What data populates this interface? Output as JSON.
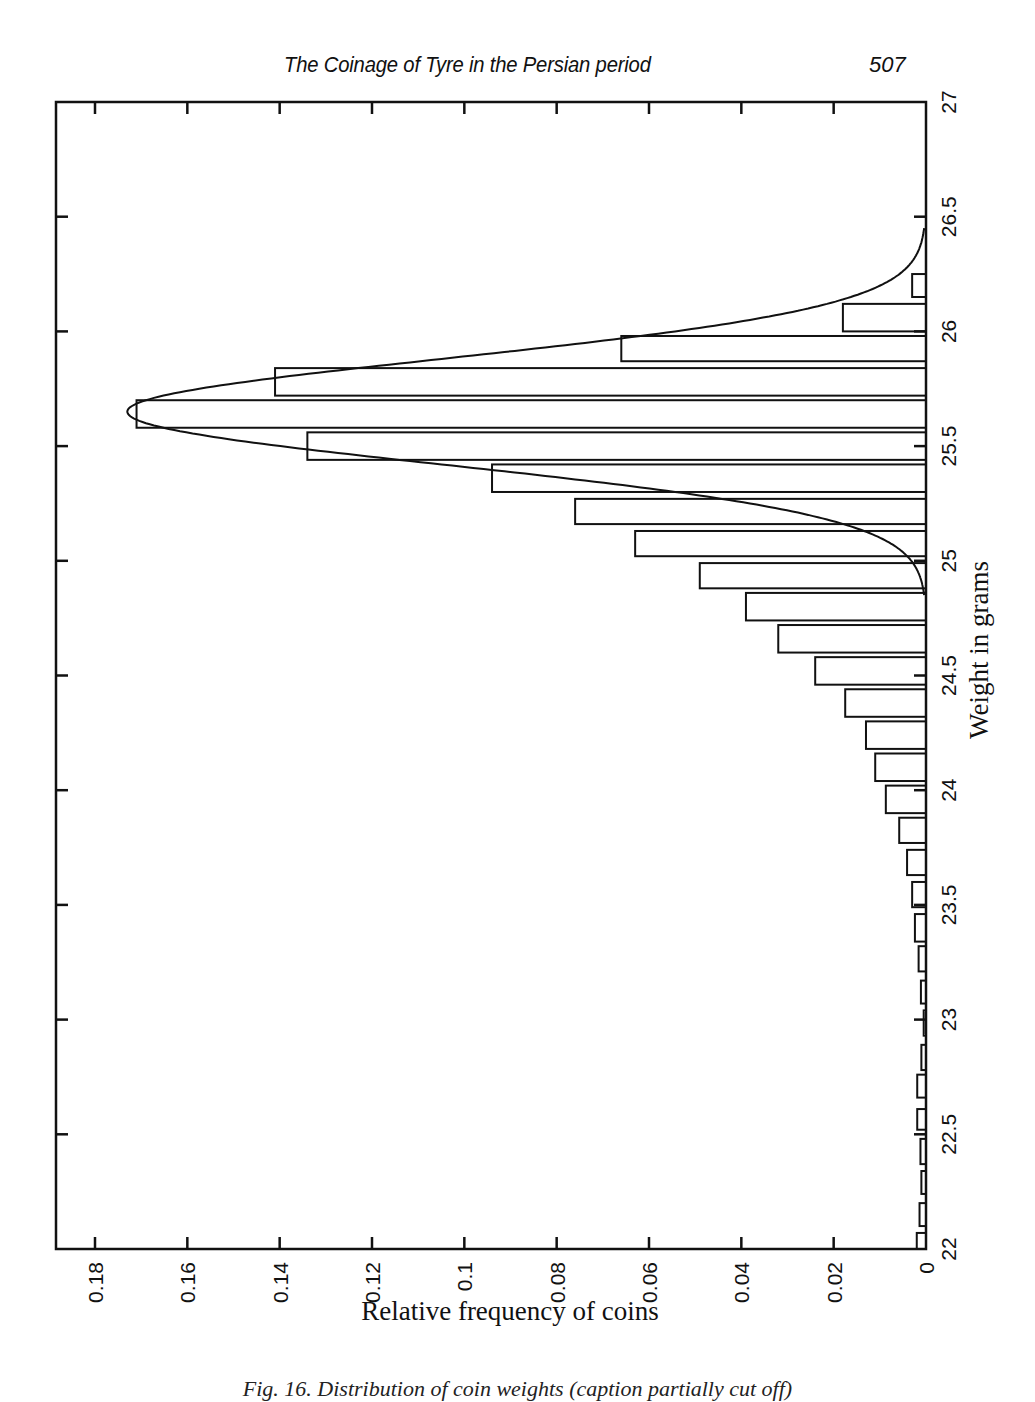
{
  "header": {
    "running_title": "The Coinage of Tyre in the Persian period",
    "page_number": "507"
  },
  "caption": "Fig. 16. Distribution of coin weights (caption partially cut off)",
  "chart_data": {
    "type": "bar",
    "orientation": "horizontal (rotated page: weight runs vertically, frequency runs right-to-left)",
    "title": "",
    "xlabel": "Weight in grams",
    "ylabel": "Relative frequency of coins",
    "xlim": [
      22,
      27
    ],
    "ylim": [
      0,
      0.19
    ],
    "x_ticks": [
      "22",
      "22.5",
      "23",
      "23.5",
      "24",
      "24.5",
      "25",
      "25.5",
      "26",
      "26.5",
      "27"
    ],
    "y_ticks": [
      "0",
      "0.02",
      "0.04",
      "0.06",
      "0.08",
      "0.1",
      "0.12",
      "0.14",
      "0.16",
      "0.18"
    ],
    "grid": false,
    "legend": null,
    "bins": [
      {
        "from": 22.0,
        "to": 22.07,
        "freq": 0.002
      },
      {
        "from": 22.1,
        "to": 22.2,
        "freq": 0.0014
      },
      {
        "from": 22.24,
        "to": 22.34,
        "freq": 0.001
      },
      {
        "from": 22.37,
        "to": 22.48,
        "freq": 0.0012
      },
      {
        "from": 22.52,
        "to": 22.61,
        "freq": 0.0019
      },
      {
        "from": 22.66,
        "to": 22.76,
        "freq": 0.0019
      },
      {
        "from": 22.78,
        "to": 22.89,
        "freq": 0.001
      },
      {
        "from": 22.93,
        "to": 23.04,
        "freq": 0.0005
      },
      {
        "from": 23.07,
        "to": 23.17,
        "freq": 0.0011
      },
      {
        "from": 23.21,
        "to": 23.32,
        "freq": 0.0016
      },
      {
        "from": 23.34,
        "to": 23.46,
        "freq": 0.0024
      },
      {
        "from": 23.49,
        "to": 23.6,
        "freq": 0.003
      },
      {
        "from": 23.63,
        "to": 23.74,
        "freq": 0.0041
      },
      {
        "from": 23.77,
        "to": 23.88,
        "freq": 0.0058
      },
      {
        "from": 23.9,
        "to": 24.02,
        "freq": 0.0087
      },
      {
        "from": 24.04,
        "to": 24.16,
        "freq": 0.011
      },
      {
        "from": 24.18,
        "to": 24.3,
        "freq": 0.013
      },
      {
        "from": 24.32,
        "to": 24.44,
        "freq": 0.0175
      },
      {
        "from": 24.46,
        "to": 24.58,
        "freq": 0.024
      },
      {
        "from": 24.6,
        "to": 24.72,
        "freq": 0.032
      },
      {
        "from": 24.74,
        "to": 24.86,
        "freq": 0.039
      },
      {
        "from": 24.88,
        "to": 24.99,
        "freq": 0.049
      },
      {
        "from": 25.02,
        "to": 25.13,
        "freq": 0.063
      },
      {
        "from": 25.16,
        "to": 25.27,
        "freq": 0.076
      },
      {
        "from": 25.3,
        "to": 25.42,
        "freq": 0.094
      },
      {
        "from": 25.44,
        "to": 25.56,
        "freq": 0.134
      },
      {
        "from": 25.58,
        "to": 25.7,
        "freq": 0.171
      },
      {
        "from": 25.72,
        "to": 25.84,
        "freq": 0.141
      },
      {
        "from": 25.87,
        "to": 25.98,
        "freq": 0.066
      },
      {
        "from": 26.0,
        "to": 26.12,
        "freq": 0.018
      },
      {
        "from": 26.15,
        "to": 26.25,
        "freq": 0.003
      }
    ],
    "fitted_curve": {
      "type": "normal",
      "mean": 25.65,
      "sigma": 0.23,
      "peak": 0.173
    }
  },
  "style": {
    "ink": "#111111",
    "paper": "#ffffff"
  }
}
